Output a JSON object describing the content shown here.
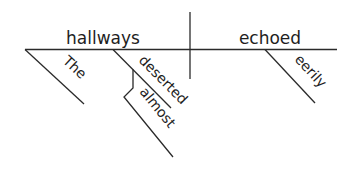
{
  "diagram": {
    "type": "Reed-Kellogg sentence diagram",
    "subject": "hallways",
    "predicate": "echoed",
    "modifiers": {
      "article": "The",
      "adjective": "deserted",
      "adverb_of_adjective": "almost",
      "adverb_of_verb": "eerily"
    },
    "colors": {
      "line": "#2a2a2a",
      "text": "#1e1e1e",
      "background": "#ffffff"
    }
  }
}
